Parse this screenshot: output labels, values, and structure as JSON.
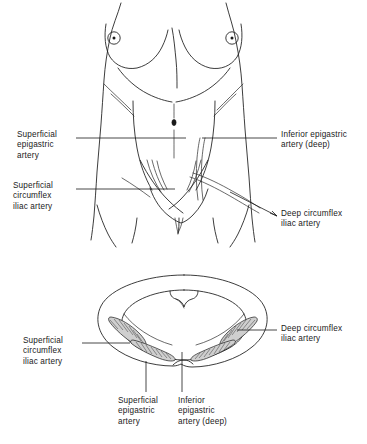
{
  "figure": {
    "views": [
      {
        "name": "anterior-torso-view",
        "description": "Anterior view of female torso showing abdominal wall vessels"
      },
      {
        "name": "cross-section-view",
        "description": "Transverse cross-section of lower abdominal wall"
      }
    ]
  },
  "labels": {
    "upper_left_1": "Superficial\nepigastric\nartery",
    "upper_left_2": "Superficial\ncircumflex\niliac artery",
    "upper_right_1": "Inferior epigastric\nartery (deep)",
    "upper_right_2": "Deep circumflex\niliac artery",
    "lower_left_1": "Superficial\ncircumflex\niliac artery",
    "lower_right_1": "Deep circumflex\niliac artery",
    "lower_center_1": "Superficial\nepigastric\nartery",
    "lower_center_2": "Inferior\nepigastric\nartery (deep)"
  },
  "colors": {
    "ink": "#1a1a1a",
    "vessel_shade": "#cfcfcf",
    "background": "#ffffff"
  }
}
